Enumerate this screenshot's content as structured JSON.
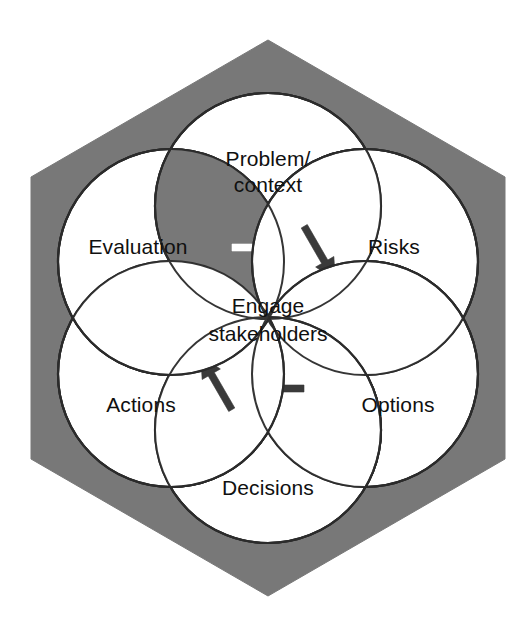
{
  "diagram": {
    "shape": "hexagon",
    "background_color": "#ffffff",
    "hexagon_fill": "#787878",
    "circle_fill": "#ffffff",
    "stroke_color": "#2b2b2b",
    "text_color": "#101010",
    "center": {
      "label_line1": "Engage",
      "label_line2": "stakeholders"
    },
    "nodes": [
      {
        "id": "problem-context",
        "label_line1": "Problem/",
        "label_line2": "context",
        "position": "top",
        "cx": 268,
        "cy": 206
      },
      {
        "id": "risks",
        "label_line1": "Risks",
        "label_line2": "",
        "position": "top-right",
        "cx": 365,
        "cy": 262
      },
      {
        "id": "options",
        "label_line1": "Options",
        "label_line2": "",
        "position": "bottom-right",
        "cx": 365,
        "cy": 374
      },
      {
        "id": "decisions",
        "label_line1": "Decisions",
        "label_line2": "",
        "position": "bottom",
        "cx": 268,
        "cy": 430
      },
      {
        "id": "actions",
        "label_line1": "Actions",
        "label_line2": "",
        "position": "bottom-left",
        "cx": 171,
        "cy": 374
      },
      {
        "id": "evaluation",
        "label_line1": "Evaluation",
        "label_line2": "",
        "position": "top-left",
        "cx": 171,
        "cy": 262
      }
    ],
    "arrows": [
      {
        "id": "evaluation-to-problem",
        "from": "evaluation",
        "to": "problem-context",
        "direction": "right",
        "style": "white-on-gray",
        "lens_fill": "#787878",
        "arrow_fill": "#ffffff"
      },
      {
        "id": "problem-to-risks",
        "from": "problem-context",
        "to": "risks",
        "direction": "down-right",
        "style": "dark-on-white",
        "lens_fill": "#ffffff",
        "arrow_fill": "#3a3a3a"
      },
      {
        "id": "risks-to-options",
        "from": "risks",
        "to": "options",
        "direction": "down-left",
        "style": "dark-on-white",
        "lens_fill": "#ffffff",
        "arrow_fill": "#3a3a3a"
      },
      {
        "id": "options-to-decisions",
        "from": "options",
        "to": "decisions",
        "direction": "left",
        "style": "dark-on-white",
        "lens_fill": "#ffffff",
        "arrow_fill": "#3a3a3a"
      },
      {
        "id": "decisions-to-actions",
        "from": "decisions",
        "to": "actions",
        "direction": "up-left",
        "style": "dark-on-white",
        "lens_fill": "#ffffff",
        "arrow_fill": "#3a3a3a"
      }
    ]
  }
}
